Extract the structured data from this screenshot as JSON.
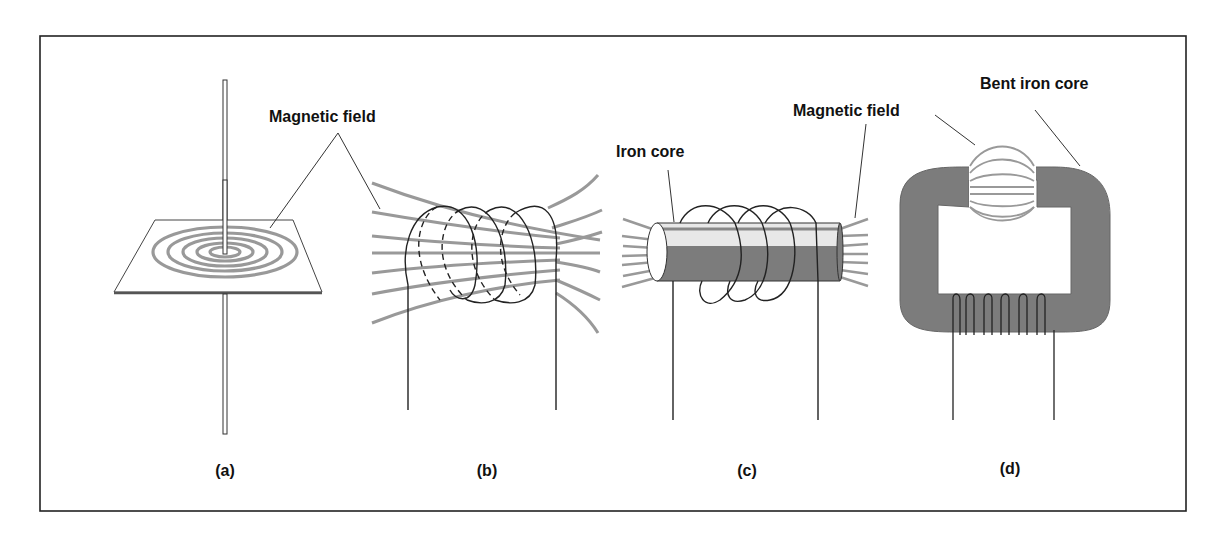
{
  "figure": {
    "panels": [
      {
        "id": "a",
        "caption": "(a)",
        "label": "Magnetic field",
        "description": "Straight wire through a plane with concentric circular field lines"
      },
      {
        "id": "b",
        "caption": "(b)",
        "description": "Air-core coil with field lines passing through"
      },
      {
        "id": "c",
        "caption": "(c)",
        "label_core": "Iron core",
        "label_field": "Magnetic field",
        "description": "Coil wound on a straight iron core"
      },
      {
        "id": "d",
        "caption": "(d)",
        "label_core": "Bent iron core",
        "description": "Coil on a bent (C-shaped) iron core with field across the gap"
      }
    ],
    "colors": {
      "line": "#1a1a1a",
      "field": "#9a9a9a",
      "core": "#7c7c7c",
      "core_highlight": "#e8e8e8",
      "frame": "#222222"
    }
  }
}
